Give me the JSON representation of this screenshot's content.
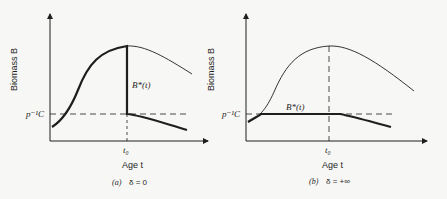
{
  "colors": {
    "ink": "#1e1e1e",
    "background": "#f7f7f5"
  },
  "panels": [
    {
      "id": "a",
      "ylabel": "Biomass  B",
      "xlabel": "Age  t",
      "threshold_label": "p⁻¹C",
      "t0_label": "t₀",
      "curve_label": "B*(t)",
      "caption_letter": "(a)",
      "caption_eq": "δ  =  0"
    },
    {
      "id": "b",
      "ylabel": "Biomass  B",
      "xlabel": "Age  t",
      "threshold_label": "p⁻¹C",
      "t0_label": "t₀",
      "curve_label": "B*(t)",
      "caption_letter": "(b)",
      "caption_eq": "δ  =  +∞"
    }
  ]
}
